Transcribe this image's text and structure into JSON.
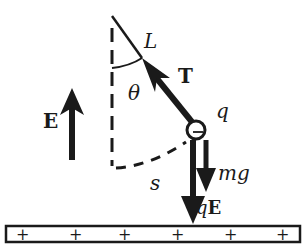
{
  "diagram": {
    "type": "physics-pendulum-charged-in-electric-field",
    "labels": {
      "string_length": "L",
      "angle": "θ",
      "tension": "T",
      "charge": "q",
      "arc_length": "s",
      "gravity_force": "mg",
      "electric_force": "qE",
      "field": "E",
      "bob_sign": "−"
    },
    "plate": {
      "signs": [
        "+",
        "+",
        "+",
        "+",
        "+",
        "+"
      ]
    },
    "colors": {
      "ink": "#1a1a1a",
      "background": "#ffffff"
    }
  }
}
